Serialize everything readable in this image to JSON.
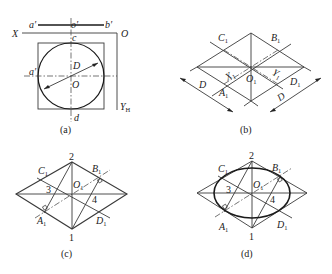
{
  "figure": {
    "panels": [
      {
        "caption": "(a)",
        "labels": {
          "a_prime_top": "a′",
          "o_prime": "o′",
          "b_prime": "b′",
          "X": "X",
          "O_axis": "O",
          "c": "c",
          "a_prime_left": "a′",
          "D": "D",
          "O": "O",
          "Y": "Y",
          "Y_sub": "H",
          "d": "d"
        }
      },
      {
        "caption": "(b)",
        "labels": {
          "C1": "C",
          "B1": "B",
          "O1": "O",
          "X1": "X",
          "Y1": "Y",
          "A1": "A",
          "D1": "D",
          "D_left": "D",
          "D_right": "D",
          "sub1": "1"
        }
      },
      {
        "caption": "(c)",
        "labels": {
          "n2": "2",
          "n1": "1",
          "n3": "3",
          "n4": "4",
          "C1": "C",
          "B1": "B",
          "O1": "O",
          "A1": "A",
          "D1": "D",
          "sub1": "1"
        }
      },
      {
        "caption": "(d)",
        "labels": {
          "n2": "2",
          "n1": "1",
          "n3": "3",
          "n4": "4",
          "C1": "C",
          "B1": "B",
          "O1": "O",
          "A1": "A",
          "D1": "D",
          "sub1": "1"
        }
      }
    ]
  }
}
